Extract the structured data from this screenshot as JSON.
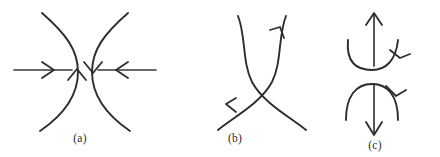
{
  "figure": {
    "background_color": "#ffffff",
    "stroke_color": "#2e2d2e",
    "panels": [
      {
        "id": "a",
        "caption": "(a)",
        "description": "Two opposing bowed arcs with horizontal arrows pointing toward each other and tangent arrowheads on the arcs",
        "elements": [
          "left-arc-bulging-right",
          "right-arc-bulging-left",
          "left-horizontal-arrow-pointing-right",
          "right-horizontal-arrow-pointing-left",
          "up-arrowhead-on-left-arc",
          "down-arrowhead-on-right-arc"
        ]
      },
      {
        "id": "b",
        "caption": "(b)",
        "description": "Two S-shaped curves crossing at mid height forming an hourglass, with arrowheads upper right and lower left",
        "elements": [
          "curve-lower-left-to-upper-right",
          "curve-upper-left-to-lower-right",
          "arrowhead-upper-right",
          "arrowhead-lower-left",
          "crossing-point"
        ]
      },
      {
        "id": "c",
        "caption": "(c)",
        "description": "Top: straight up arrow inside a U curve with arrowhead at its right end. Bottom: straight down arrow under an arch with arrowhead at its right end",
        "elements": [
          "upward-straight-arrow",
          "u-shaped-curve-with-arrowhead",
          "downward-straight-arrow",
          "arch-curve-with-arrowhead"
        ]
      }
    ]
  }
}
